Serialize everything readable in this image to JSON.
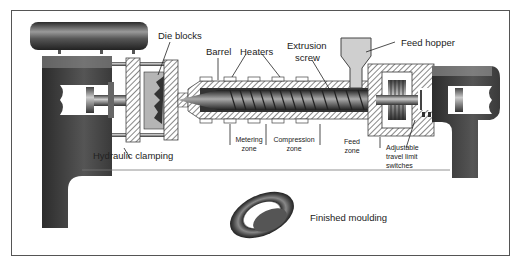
{
  "diagram": {
    "labels": {
      "die_blocks": "Die blocks",
      "barrel": "Barrel",
      "heaters": "Heaters",
      "extrusion_screw_line1": "Extrusion",
      "extrusion_screw_line2": "screw",
      "feed_hopper": "Feed hopper",
      "hydraulic_clamping": "Hydraulic clamping",
      "metering_zone_line1": "Metering",
      "metering_zone_line2": "zone",
      "compression_zone_line1": "Compression",
      "compression_zone_line2": "zone",
      "feed_zone_line1": "Feed",
      "feed_zone_line2": "zone",
      "limit_switches_line1": "Adjustable",
      "limit_switches_line2": "travel limit",
      "limit_switches_line3": "switches",
      "finished_moulding": "Finished moulding"
    },
    "colors": {
      "frame": "#555555",
      "machine_dark": "#3a3a3a",
      "hatch": "#6a6a6a",
      "hopper_fill": "#cfcfcf",
      "text": "#222222"
    }
  }
}
